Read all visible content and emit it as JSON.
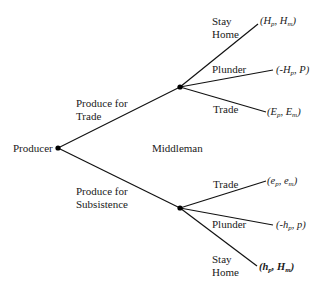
{
  "tree": {
    "root": {
      "label": "Producer"
    },
    "middle_label": "Middleman",
    "producer_moves": [
      {
        "line1": "Produce for",
        "line2": "Trade"
      },
      {
        "line1": "Produce for",
        "line2": "Subsistence"
      }
    ],
    "upper_branches": [
      {
        "line1": "Stay",
        "line2": "Home",
        "payoff": {
          "a": "H",
          "a_sub": "p",
          "b": "H",
          "b_sub": "m",
          "prefix": "",
          "bold": false
        }
      },
      {
        "line1": "Plunder",
        "payoff": {
          "a": "H",
          "a_sub": "p",
          "b": "P",
          "b_sub": "",
          "prefix": "-",
          "bold": false
        }
      },
      {
        "line1": "Trade",
        "payoff": {
          "a": "E",
          "a_sub": "p",
          "b": "E",
          "b_sub": "m",
          "prefix": "",
          "bold": false
        }
      }
    ],
    "lower_branches": [
      {
        "line1": "Trade",
        "payoff": {
          "a": "e",
          "a_sub": "p",
          "b": "e",
          "b_sub": "m",
          "prefix": "",
          "bold": false
        }
      },
      {
        "line1": "Plunder",
        "payoff": {
          "a": "h",
          "a_sub": "p",
          "b": "p",
          "b_sub": "",
          "prefix": "-",
          "bold": false
        }
      },
      {
        "line1": "Stay",
        "line2": "Home",
        "payoff": {
          "a": "h",
          "a_sub": "p",
          "b": "H",
          "b_sub": "m",
          "prefix": "",
          "bold": true
        }
      }
    ]
  }
}
